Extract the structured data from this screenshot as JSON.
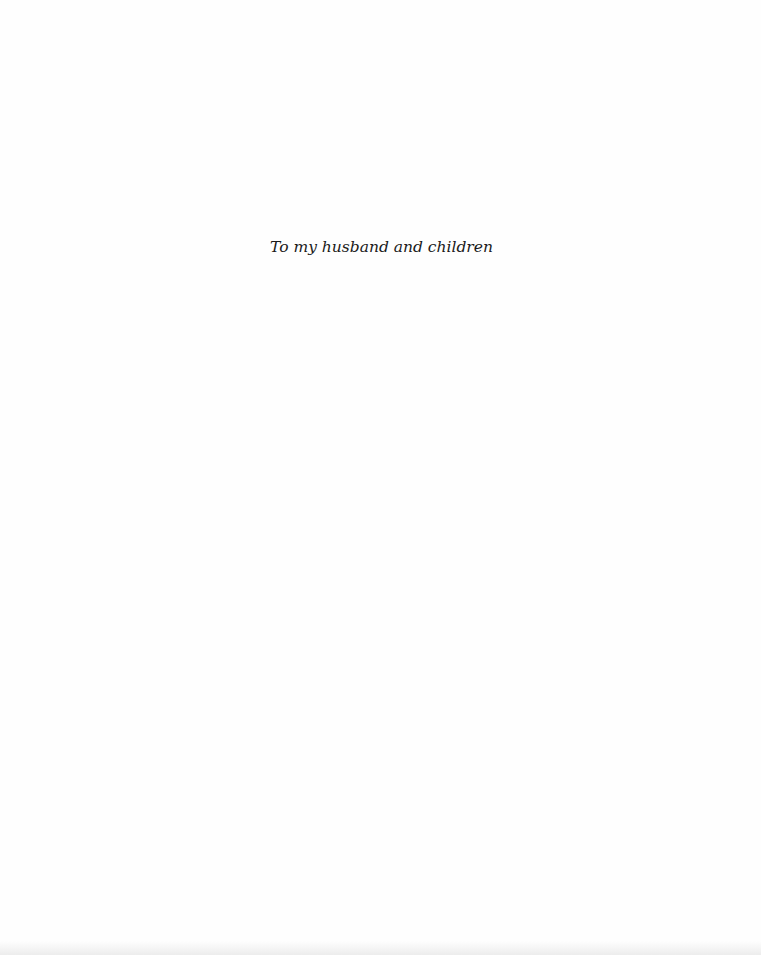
{
  "page": {
    "dedication": "To my husband and children"
  }
}
